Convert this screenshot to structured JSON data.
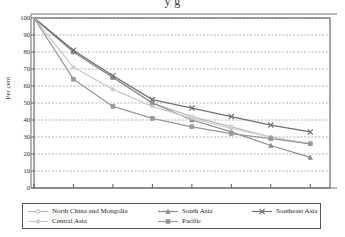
{
  "chart": {
    "title_partial": "y g",
    "ylabel": "Per cent"
  },
  "chart_data": {
    "type": "line",
    "title": "",
    "xlabel": "",
    "ylabel": "Per cent",
    "x": [
      1950,
      1960,
      1970,
      1980,
      1990,
      2000,
      2010,
      2020
    ],
    "xlim": [
      1950,
      2025
    ],
    "ylim": [
      0,
      100
    ],
    "ytick_labels": [
      "0",
      "10",
      "20",
      "30",
      "40",
      "50",
      "60",
      "70",
      "80",
      "90",
      "100"
    ],
    "yticks": [
      0,
      10,
      20,
      30,
      40,
      50,
      60,
      70,
      80,
      90,
      100
    ],
    "xtick_labels": [
      "1950",
      "1960",
      "1970",
      "1980",
      "1990",
      "2000",
      "2010",
      "2020"
    ],
    "grid": true,
    "grid_style": "dotted-horizontal",
    "legend_position": "bottom",
    "series": [
      {
        "name": "North China and Mongolia",
        "marker": "circle-open",
        "color": "#b9b9b9",
        "values": [
          100,
          80,
          65,
          50,
          42,
          36,
          30,
          26
        ]
      },
      {
        "name": "South Asia",
        "marker": "triangle",
        "color": "#8c8c8c",
        "values": [
          100,
          80,
          65,
          50,
          40,
          33,
          25,
          18
        ]
      },
      {
        "name": "Southeast Asia",
        "marker": "x-cross",
        "color": "#707070",
        "values": [
          100,
          81,
          66,
          52,
          47,
          42,
          37,
          33
        ]
      },
      {
        "name": "Central Asia",
        "marker": "circle-small",
        "color": "#cccccc",
        "values": [
          100,
          71,
          58,
          48,
          41,
          35,
          30,
          26
        ]
      },
      {
        "name": "Pacific",
        "marker": "square-filled",
        "color": "#989898",
        "values": [
          100,
          64,
          48,
          41,
          36,
          32,
          29,
          26
        ]
      }
    ]
  }
}
